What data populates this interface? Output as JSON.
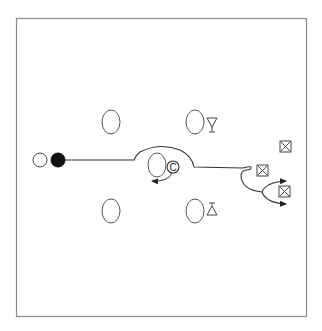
{
  "diagram": {
    "title": "Drill diagram",
    "frame": {
      "x": 16,
      "y": 18,
      "width": 290,
      "height": 298,
      "stroke": "#8a8a8a"
    },
    "colors": {
      "line": "#3a3a3a",
      "fill_dark": "#111111",
      "background": "#ffffff"
    },
    "start_markers": [
      {
        "id": "open-circle",
        "type": "open-circle",
        "cx": 40,
        "cy": 160,
        "r": 7
      },
      {
        "id": "filled-circle",
        "type": "filled-circle",
        "cx": 58,
        "cy": 160,
        "r": 7
      }
    ],
    "ovals": [
      {
        "id": "oval-top-left",
        "cx": 111,
        "cy": 122,
        "rx": 9,
        "ry": 12
      },
      {
        "id": "oval-top-right",
        "cx": 195,
        "cy": 122,
        "rx": 9,
        "ry": 12
      },
      {
        "id": "oval-center",
        "cx": 157,
        "cy": 165,
        "rx": 9,
        "ry": 12
      },
      {
        "id": "oval-bottom-left",
        "cx": 111,
        "cy": 211,
        "rx": 9,
        "ry": 12
      },
      {
        "id": "oval-bottom-right",
        "cx": 195,
        "cy": 211,
        "rx": 9,
        "ry": 12
      }
    ],
    "triangles": [
      {
        "id": "triangle-down",
        "direction": "down",
        "x": 212,
        "y": 124
      },
      {
        "id": "triangle-up",
        "direction": "up",
        "x": 212,
        "y": 211
      }
    ],
    "coach_marker": {
      "label": "C",
      "cx": 173,
      "cy": 167,
      "r": 6
    },
    "boxed_x_markers": [
      {
        "id": "box-x-top",
        "x": 285,
        "y": 146,
        "size": 10
      },
      {
        "id": "box-x-middle",
        "x": 263,
        "y": 170,
        "size": 10
      },
      {
        "id": "box-x-bottom",
        "x": 284,
        "y": 191,
        "size": 10
      }
    ]
  }
}
